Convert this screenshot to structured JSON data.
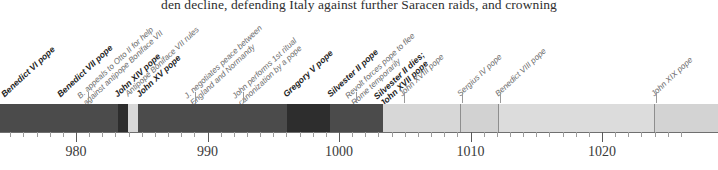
{
  "document": {
    "body_text_fragment": "den decline, defending Italy against further Saracen raids, and crowning"
  },
  "figure": {
    "type": "timeline",
    "units": "year",
    "axis": {
      "start_year": 972.2,
      "end_year": 1026.8,
      "pixels_per_year": 13.15,
      "origin_px": 76,
      "origin_year": 980,
      "major_tick_step": 10,
      "minor_tick_step": 1,
      "major_tick_labels": [
        "980",
        "990",
        "1000",
        "1010",
        "1020"
      ],
      "major_tick_years": [
        980,
        990,
        1000,
        1010,
        1020
      ]
    },
    "colors": {
      "bar_dark": "#4b4b4b",
      "bar_darker": "#2d2d2d",
      "bar_light_highlight": "#d8d8d8",
      "bar_pale": "#d7d7d7",
      "bar_pale_alt": "#d2d2d2",
      "divider": "#8e8e8e",
      "axis_line": "#6f6f6f",
      "pope_label_text": "#1d1d1d",
      "note_label_text": "#6b6b6b"
    },
    "segments": [
      {
        "name": "benedict-vi-reign",
        "x": 0,
        "width": 118,
        "color": "#4b4b4b"
      },
      {
        "name": "antipope-boniface-rule",
        "x": 118,
        "width": 10,
        "color": "#2d2d2d"
      },
      {
        "name": "john-xiv-highlight",
        "x": 128,
        "width": 10,
        "color": "#d8d8d8"
      },
      {
        "name": "john-xv-reign",
        "x": 138,
        "width": 149,
        "color": "#4b4b4b"
      },
      {
        "name": "gregory-v-reign",
        "x": 287,
        "width": 43,
        "color": "#2d2d2d"
      },
      {
        "name": "silvester-ii-reign",
        "x": 330,
        "width": 53,
        "color": "#4b4b4b"
      },
      {
        "name": "john-xvii-xviii-reign",
        "x": 383,
        "width": 77,
        "color": "#d7d7d7"
      },
      {
        "name": "sergius-iv-reign",
        "x": 460,
        "width": 38,
        "color": "#d2d2d2"
      },
      {
        "name": "benedict-viii-reign",
        "x": 498,
        "width": 156,
        "color": "#dcdcdc"
      },
      {
        "name": "john-xix-reign",
        "x": 654,
        "width": 64,
        "color": "#d3d3d3"
      }
    ],
    "dividers_px": [
      460,
      498,
      654
    ],
    "events": [
      {
        "kind": "pope",
        "label": "Benedict VI pope",
        "label_line2": "",
        "x": 6,
        "y": 72,
        "anchor_px": 6,
        "leader": false
      },
      {
        "kind": "pope",
        "label": "Benedict VII pope",
        "label_line2": "",
        "x": 62,
        "y": 72,
        "anchor_px": 62,
        "leader": false
      },
      {
        "kind": "note",
        "label": "B. appeals to Otto II for help",
        "label_line2": "against antipope Boniface VII",
        "x": 88,
        "y": 72,
        "anchor_px": 88,
        "leader": true
      },
      {
        "kind": "pope",
        "label": "John XIV pope",
        "label_line2": "",
        "x": 119,
        "y": 72,
        "anchor_px": 119,
        "leader": false
      },
      {
        "kind": "note",
        "label": "Antipope Boniface VII rules",
        "label_line2": "",
        "x": 130,
        "y": 72,
        "anchor_px": 130,
        "leader": false
      },
      {
        "kind": "pope",
        "label": "John XV pope",
        "label_line2": "",
        "x": 141,
        "y": 72,
        "anchor_px": 141,
        "leader": false
      },
      {
        "kind": "note",
        "label": "J. negotiates peace between",
        "label_line2": "England and Normandy",
        "x": 195,
        "y": 72,
        "anchor_px": 195,
        "leader": true
      },
      {
        "kind": "note",
        "label": "John performs 1st ritual",
        "label_line2": "canonization by a pope",
        "x": 243,
        "y": 72,
        "anchor_px": 243,
        "leader": true
      },
      {
        "kind": "pope",
        "label": "Gregory V pope",
        "label_line2": "",
        "x": 288,
        "y": 72,
        "anchor_px": 288,
        "leader": false
      },
      {
        "kind": "pope",
        "label": "Silvester II pope",
        "label_line2": "",
        "x": 332,
        "y": 72,
        "anchor_px": 332,
        "leader": false
      },
      {
        "kind": "note",
        "label": "Revolt forces pope to flee",
        "label_line2": "Rome temporarily",
        "x": 356,
        "y": 72,
        "anchor_px": 356,
        "leader": true
      },
      {
        "kind": "pope",
        "label": "Silvester II dies;",
        "label_line2": "John XVII pope",
        "x": 385,
        "y": 72,
        "anchor_px": 385,
        "leader": false
      },
      {
        "kind": "note",
        "label": "John XVIII pope",
        "label_line2": "",
        "x": 404,
        "y": 72,
        "anchor_px": 404,
        "leader": true
      },
      {
        "kind": "note",
        "label": "Sergius IV pope",
        "label_line2": "",
        "x": 462,
        "y": 72,
        "anchor_px": 462,
        "leader": true
      },
      {
        "kind": "note",
        "label": "Benedict VIII pope",
        "label_line2": "",
        "x": 500,
        "y": 72,
        "anchor_px": 500,
        "leader": true
      },
      {
        "kind": "note",
        "label": "John XIX pope",
        "label_line2": "",
        "x": 656,
        "y": 72,
        "anchor_px": 656,
        "leader": true
      }
    ]
  },
  "chart_data": {
    "type": "timeline",
    "title": "",
    "xlabel": "",
    "ylabel": "",
    "xlim": [
      972.2,
      1026.8
    ],
    "grid": false,
    "legend": "none",
    "tick_labels": [
      "980",
      "990",
      "1000",
      "1010",
      "1020"
    ],
    "tick_values": [
      980,
      990,
      1000,
      1010,
      1020
    ],
    "annotations": [
      "Benedict VI pope",
      "Benedict VII pope",
      "B. appeals to Otto II for help against antipope Boniface VII",
      "John XIV pope",
      "Antipope Boniface VII rules",
      "John XV pope",
      "J. negotiates peace between England and Normandy",
      "John performs 1st ritual canonization by a pope",
      "Gregory V pope",
      "Silvester II pope",
      "Revolt forces pope to flee Rome temporarily",
      "Silvester II dies; John XVII pope",
      "John XVIII pope",
      "Sergius IV pope",
      "Benedict VIII pope",
      "John XIX pope"
    ]
  }
}
